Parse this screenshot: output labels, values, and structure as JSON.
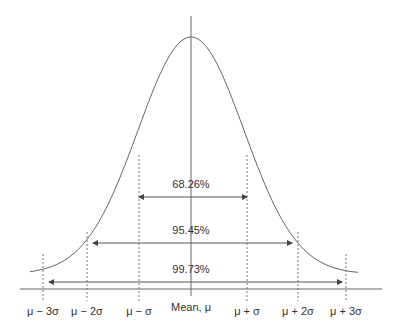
{
  "chart_data": {
    "type": "line",
    "title": "",
    "xlabel": "",
    "ylabel": "",
    "x_ticks": [
      "μ − 3σ",
      "μ − 2σ",
      "μ − σ",
      "Mean, μ",
      "μ + σ",
      "μ + 2σ",
      "μ + 3σ"
    ],
    "x_sigma": [
      -3,
      -2,
      -1,
      0,
      1,
      2,
      3
    ],
    "intervals": [
      {
        "label": "68.26%",
        "from": -1,
        "to": 1
      },
      {
        "label": "95.45%",
        "from": -2,
        "to": 2
      },
      {
        "label": "99.73%",
        "from": -3,
        "to": 3
      }
    ],
    "grid": false
  },
  "labels": {
    "m3": "μ − 3σ",
    "m2": "μ − 2σ",
    "m1": "μ − σ",
    "mean": "Mean, μ",
    "p1": "μ + σ",
    "p2": "μ + 2σ",
    "p3": "μ + 3σ"
  },
  "percents": {
    "one": "68.26%",
    "two": "95.45%",
    "three": "99.73%"
  },
  "colors": {
    "line": "#555555",
    "text": "#333333"
  }
}
